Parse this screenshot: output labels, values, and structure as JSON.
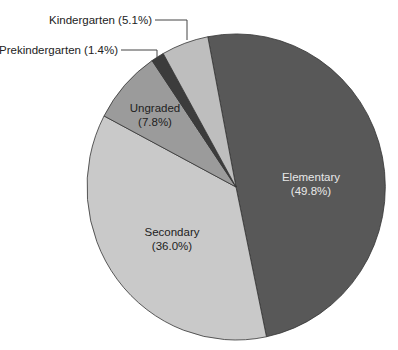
{
  "chart_data": {
    "type": "pie",
    "title": "",
    "start_angle_deg": -10.9,
    "direction": "clockwise",
    "slices": [
      {
        "label": "Elementary",
        "value": 49.8,
        "display": "(49.8%)",
        "color": "#585858",
        "label_style": "inside-light"
      },
      {
        "label": "Secondary",
        "value": 36.0,
        "display": "(36.0%)",
        "color": "#c9c9c9",
        "label_style": "inside"
      },
      {
        "label": "Ungraded",
        "value": 7.8,
        "display": "(7.8%)",
        "color": "#9b9b9b",
        "label_style": "inside"
      },
      {
        "label": "Prekindergarten",
        "value": 1.4,
        "display": "Prekindergarten (1.4%)",
        "color": "#3c3c3c",
        "label_style": "outside-leader"
      },
      {
        "label": "Kindergarten",
        "value": 5.1,
        "display": "Kindergarten (5.1%)",
        "color": "#bebebe",
        "label_style": "outside-leader"
      }
    ],
    "legend": "none",
    "units": "percent"
  },
  "labels": {
    "elementary_name": "Elementary",
    "elementary_pct": "(49.8%)",
    "secondary_name": "Secondary",
    "secondary_pct": "(36.0%)",
    "ungraded_name": "Ungraded",
    "ungraded_pct": "(7.8%)",
    "prekindergarten": "Prekindergarten (1.4%)",
    "kindergarten": "Kindergarten (5.1%)"
  }
}
